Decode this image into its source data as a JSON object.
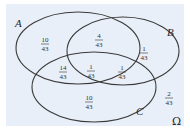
{
  "diagram": {
    "type": "venn",
    "universe_label": "Ω",
    "sets": [
      {
        "name": "A"
      },
      {
        "name": "B"
      },
      {
        "name": "C"
      }
    ],
    "regions": {
      "A_only": {
        "num": "10",
        "den": "43"
      },
      "A_and_B_only": {
        "num": "4",
        "den": "43"
      },
      "B_only": {
        "num": "1",
        "den": "43"
      },
      "A_and_C_only": {
        "num": "14",
        "den": "43"
      },
      "A_and_B_and_C": {
        "num": "1",
        "den": "43"
      },
      "B_and_C_only": {
        "num": "1",
        "den": "43"
      },
      "C_only": {
        "num": "10",
        "den": "43"
      },
      "outside": {
        "num": "2",
        "den": "43"
      }
    },
    "colors": {
      "background": "#e9eff8",
      "stroke": "#3a3a3a"
    }
  }
}
